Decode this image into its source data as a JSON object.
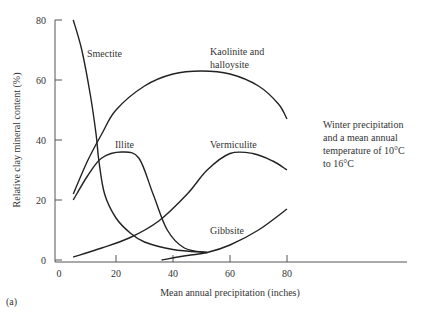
{
  "chart_data": {
    "type": "line",
    "title": "",
    "xlabel": "Mean annual precipitation (inches)",
    "ylabel": "Relative clay mineral content (%)",
    "xlim": [
      0,
      120
    ],
    "ylim": [
      0,
      80
    ],
    "xticks": [
      0,
      20,
      40,
      60,
      80
    ],
    "yticks": [
      0,
      20,
      40,
      60,
      80
    ],
    "grid": false,
    "legend": "inline labels",
    "series": [
      {
        "name": "Smectite",
        "label_lines": [
          "Smectite"
        ],
        "x": [
          5,
          8,
          11,
          13,
          14,
          16,
          20,
          25,
          30,
          40,
          52
        ],
        "y": [
          80,
          70,
          55,
          42,
          33,
          22,
          14,
          9,
          6,
          3.5,
          2.5
        ]
      },
      {
        "name": "Kaolinite and halloysite",
        "label_lines": [
          "Kaolinite and",
          "halloysite"
        ],
        "x": [
          5,
          10,
          15,
          20,
          30,
          40,
          50,
          60,
          70,
          77,
          80
        ],
        "y": [
          22,
          33,
          42,
          50,
          58,
          62,
          63,
          62,
          58,
          52,
          47
        ]
      },
      {
        "name": "Illite",
        "label_lines": [
          "Illite"
        ],
        "x": [
          5,
          10,
          15,
          22,
          28,
          33,
          38,
          44,
          52
        ],
        "y": [
          20,
          28,
          34,
          36,
          34,
          22,
          10,
          4,
          2.5
        ]
      },
      {
        "name": "Vermiculite",
        "label_lines": [
          "Vermiculite"
        ],
        "x": [
          5,
          15,
          25,
          35,
          45,
          52,
          60,
          68,
          75,
          80
        ],
        "y": [
          1,
          4,
          7.5,
          13,
          22,
          30,
          35.5,
          35.5,
          33,
          30
        ]
      },
      {
        "name": "Gibbsite",
        "label_lines": [
          "Gibbsite"
        ],
        "x": [
          36,
          45,
          52,
          60,
          70,
          80
        ],
        "y": [
          0,
          1.5,
          2.5,
          5,
          10,
          17
        ]
      }
    ],
    "annotations": [
      "Winter precipitation and a mean annual temperature of 10°C to 16°C"
    ]
  },
  "note": {
    "text": "Winter precipitation and a mean annual temperature of 10°C to 16°C",
    "lines": [
      "Winter precipitation",
      "and a mean annual",
      "temperature of 10°C",
      "to 16°C"
    ]
  },
  "panel_label": "(a)",
  "style": {
    "line_color": "#222222",
    "axis_color": "#555555"
  }
}
